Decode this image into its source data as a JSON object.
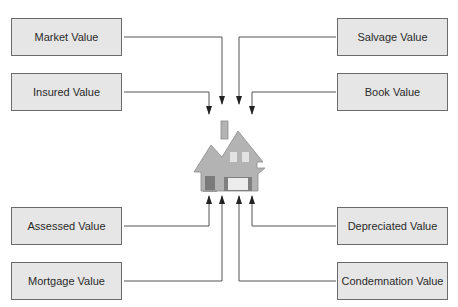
{
  "diagram": {
    "center": {
      "label": "house-icon"
    },
    "left_boxes": [
      {
        "label": "Market Value"
      },
      {
        "label": "Insured Value"
      },
      {
        "label": "Assessed Value"
      },
      {
        "label": "Mortgage Value"
      }
    ],
    "right_boxes": [
      {
        "label": "Salvage Value"
      },
      {
        "label": "Book Value"
      },
      {
        "label": "Depreciated Value"
      },
      {
        "label": "Condemnation Value"
      }
    ],
    "colors": {
      "box_fill": "#e6e6e6",
      "box_border": "#6b6b6b",
      "line": "#444444",
      "house_fill": "#b3b3b3",
      "house_outline": "#8c8c8c",
      "door": "#7a7a7a",
      "window": "#e8e8e8"
    }
  }
}
